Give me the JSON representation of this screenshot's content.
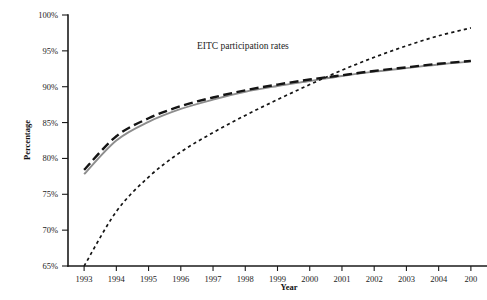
{
  "figure": {
    "background_color": "#ffffff",
    "annotation": "EITC participation rates"
  },
  "chart_data": {
    "type": "line",
    "title": "EITC participation rates",
    "xlabel": "Year",
    "ylabel": "Percentage",
    "xlim": [
      1993,
      2005
    ],
    "ylim": [
      65,
      100
    ],
    "grid": false,
    "legend": "none",
    "x_tick_labels": [
      "1993",
      "1994",
      "1995",
      "1996",
      "1997",
      "1998",
      "1999",
      "2000",
      "2001",
      "2002",
      "2003",
      "2004",
      "200"
    ],
    "y_tick_labels": [
      "65%",
      "70%",
      "75%",
      "80%",
      "85%",
      "90%",
      "95%",
      "100%"
    ],
    "x": [
      1993,
      1994,
      1995,
      1996,
      1997,
      1998,
      1999,
      2000,
      2001,
      2002,
      2003,
      2004,
      2005
    ],
    "series": [
      {
        "name": "solid-gray-series",
        "style": "solid",
        "color": "#8d8d8d",
        "width": 1.9,
        "values": [
          77.8,
          82.5,
          85.1,
          86.9,
          88.2,
          89.3,
          90.1,
          90.8,
          91.5,
          92.1,
          92.6,
          93.1,
          93.5
        ]
      },
      {
        "name": "long-dashed-black-series",
        "style": "long-dash",
        "color": "#141414",
        "width": 2.4,
        "values": [
          78.4,
          83.1,
          85.6,
          87.3,
          88.5,
          89.5,
          90.3,
          91.0,
          91.6,
          92.2,
          92.7,
          93.2,
          93.6
        ]
      },
      {
        "name": "dotted-black-series",
        "style": "short-dash",
        "color": "#141414",
        "width": 1.7,
        "values": [
          65.0,
          72.6,
          77.4,
          80.9,
          83.6,
          86.0,
          88.2,
          90.3,
          92.3,
          94.1,
          95.7,
          97.1,
          98.2
        ]
      }
    ]
  }
}
